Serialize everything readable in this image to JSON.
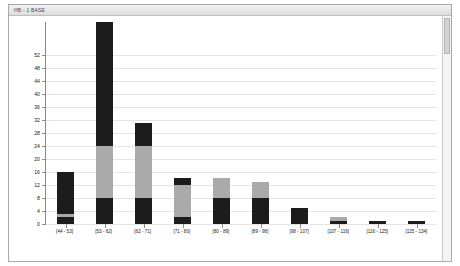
{
  "window": {
    "title": "HB - 1 BASE",
    "scrollbar_name": "vertical-scrollbar"
  },
  "chart_data": {
    "type": "bar",
    "subtype": "stacked-histogram",
    "title": "",
    "xlabel": "",
    "ylabel": "",
    "ylim": [
      0,
      62
    ],
    "yticks": [
      0,
      4,
      8,
      12,
      16,
      20,
      24,
      28,
      32,
      36,
      40,
      44,
      48,
      52
    ],
    "ytick_labels": [
      "0",
      "4",
      "8",
      "12",
      "16",
      "20",
      "24",
      "28",
      "32",
      "36",
      "40",
      "44",
      "48",
      "52"
    ],
    "grid": true,
    "grid_axis": "y",
    "legend": "none",
    "categories": [
      "[44 - 53]",
      "[53 - 62]",
      "[62 - 71]",
      "[71 - 80]",
      "[80 - 89]",
      "[89 - 98]",
      "[98 - 107]",
      "[107 - 116]",
      "[116 - 125]",
      "[125 - 134]"
    ],
    "series": [
      {
        "name": "bottom",
        "color": "#1c1c1c",
        "values": [
          2,
          8,
          8,
          2,
          8,
          8,
          5,
          1,
          1,
          1
        ]
      },
      {
        "name": "middle",
        "color": "#aaaaaa",
        "values": [
          1,
          16,
          16,
          10,
          6,
          5,
          0,
          1,
          0,
          0
        ]
      },
      {
        "name": "top",
        "color": "#1c1c1c",
        "values": [
          13,
          38,
          7,
          2,
          0,
          0,
          0,
          0,
          0,
          0
        ]
      }
    ],
    "totals": [
      16,
      62,
      31,
      14,
      14,
      13,
      5,
      2,
      1,
      1
    ]
  },
  "colors": {
    "bar_dark": "#1c1c1c",
    "bar_light": "#aaaaaa",
    "axis": "#8a8a8a",
    "grid": "#e4e4e4",
    "frame": "#a8a8a8"
  }
}
